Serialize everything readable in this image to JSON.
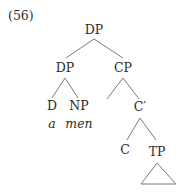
{
  "example_number": "(56)",
  "tree": {
    "root": "DP",
    "nodes": {
      "dp_root": "DP",
      "dp_left": "DP",
      "cp": "CP",
      "d": "D",
      "np": "NP",
      "word_a": "a",
      "word_men": "men",
      "c_bar": "C′",
      "c": "C",
      "tp": "TP"
    }
  }
}
